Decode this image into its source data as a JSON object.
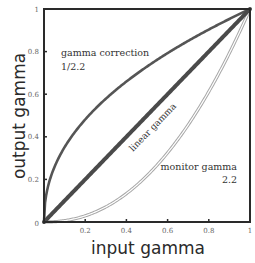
{
  "chart_data": {
    "type": "line",
    "title": "",
    "xlabel": "input gamma",
    "ylabel": "output gamma",
    "xlim": [
      0,
      1
    ],
    "ylim": [
      0,
      1
    ],
    "xticks": [
      "0",
      "0.2",
      "0.4",
      "0.6",
      "0.8",
      "1"
    ],
    "yticks": [
      "0",
      "0.2",
      "0.4",
      "0.6",
      "0.8",
      "1"
    ],
    "grid": false,
    "legend": "none (inline annotations)",
    "series": [
      {
        "name": "gamma correction",
        "exponent": 0.4545,
        "formula": "y = x^(1/2.2)",
        "color": "#555555",
        "style": "solid"
      },
      {
        "name": "linear gamma",
        "exponent": 1.0,
        "formula": "y = x",
        "color": "#4a4a4a",
        "style": "thick solid"
      },
      {
        "name": "monitor gamma",
        "exponent": 2.2,
        "formula": "y = x^2.2",
        "color": "#aaaaaa",
        "style": "hollow double line"
      }
    ],
    "annotations": [
      {
        "text": "gamma correction",
        "line2": "1/2.2"
      },
      {
        "text": "linear gamma",
        "rotated": true
      },
      {
        "text": "monitor gamma",
        "line2": "2.2"
      }
    ]
  },
  "labels": {
    "xlabel": "input gamma",
    "ylabel": "output gamma",
    "gamma_correction": "gamma correction",
    "gamma_correction_value": "1/2.2",
    "linear_gamma": "linear gamma",
    "monitor_gamma": "monitor gamma",
    "monitor_gamma_value": "2.2",
    "xticks": [
      "0",
      "0.2",
      "0.4",
      "0.6",
      "0.8",
      "1"
    ],
    "yticks": [
      "0",
      "0.2",
      "0.4",
      "0.6",
      "0.8",
      "1"
    ]
  },
  "colors": {
    "frame": "#2a2a2a",
    "correction": "#555555",
    "linear": "#4a4a4a",
    "monitor_outer": "#a8a8a8",
    "monitor_inner": "#ffffff"
  }
}
